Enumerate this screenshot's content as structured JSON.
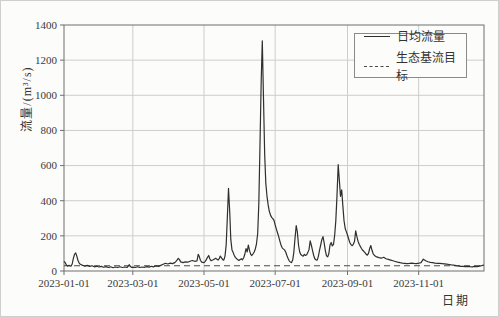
{
  "chart_data": {
    "type": "line",
    "title": "",
    "xlabel": "日期",
    "ylabel": "流量/(m³/s)",
    "ylim": [
      0,
      1400
    ],
    "x_range_days": [
      0,
      360
    ],
    "grid": true,
    "legend_position": "top-right",
    "colors": {
      "line": "#2f2f2f",
      "target": "#4a4a4a",
      "grid": "#cdcdcd",
      "frame": "#6f6f6f",
      "tick_text": "#3a3a3a"
    },
    "y_ticks": [
      0,
      200,
      400,
      600,
      800,
      1000,
      1200,
      1400
    ],
    "x_ticks": [
      {
        "day": 0,
        "label": "2023-01-01"
      },
      {
        "day": 59,
        "label": "2023-03-01"
      },
      {
        "day": 120,
        "label": "2023-05-01"
      },
      {
        "day": 181,
        "label": "2023-07-01"
      },
      {
        "day": 243,
        "label": "2023-09-01"
      },
      {
        "day": 304,
        "label": "2023-11-01"
      }
    ],
    "series": [
      {
        "name": "日均流量",
        "style": "solid",
        "points": [
          [
            0,
            55
          ],
          [
            1,
            48
          ],
          [
            2,
            35
          ],
          [
            3,
            28
          ],
          [
            4,
            32
          ],
          [
            5,
            30
          ],
          [
            6,
            28
          ],
          [
            7,
            40
          ],
          [
            8,
            70
          ],
          [
            9,
            95
          ],
          [
            10,
            103
          ],
          [
            11,
            85
          ],
          [
            12,
            60
          ],
          [
            13,
            45
          ],
          [
            14,
            38
          ],
          [
            16,
            32
          ],
          [
            18,
            28
          ],
          [
            20,
            32
          ],
          [
            22,
            26
          ],
          [
            24,
            30
          ],
          [
            26,
            24
          ],
          [
            28,
            27
          ],
          [
            30,
            23
          ],
          [
            32,
            26
          ],
          [
            34,
            21
          ],
          [
            36,
            25
          ],
          [
            38,
            20
          ],
          [
            40,
            24
          ],
          [
            42,
            19
          ],
          [
            44,
            23
          ],
          [
            46,
            20
          ],
          [
            48,
            24
          ],
          [
            50,
            20
          ],
          [
            52,
            23
          ],
          [
            54,
            20
          ],
          [
            55,
            28
          ],
          [
            56,
            36
          ],
          [
            57,
            25
          ],
          [
            58,
            20
          ],
          [
            59,
            22
          ],
          [
            61,
            20
          ],
          [
            63,
            24
          ],
          [
            65,
            20
          ],
          [
            67,
            23
          ],
          [
            69,
            21
          ],
          [
            71,
            25
          ],
          [
            73,
            22
          ],
          [
            75,
            27
          ],
          [
            77,
            24
          ],
          [
            79,
            29
          ],
          [
            81,
            26
          ],
          [
            83,
            32
          ],
          [
            85,
            38
          ],
          [
            87,
            44
          ],
          [
            89,
            40
          ],
          [
            91,
            45
          ],
          [
            93,
            42
          ],
          [
            95,
            48
          ],
          [
            96,
            55
          ],
          [
            97,
            63
          ],
          [
            98,
            72
          ],
          [
            99,
            65
          ],
          [
            100,
            52
          ],
          [
            102,
            48
          ],
          [
            104,
            52
          ],
          [
            106,
            50
          ],
          [
            108,
            56
          ],
          [
            110,
            60
          ],
          [
            112,
            55
          ],
          [
            114,
            58
          ],
          [
            115,
            95
          ],
          [
            116,
            82
          ],
          [
            117,
            60
          ],
          [
            118,
            50
          ],
          [
            120,
            47
          ],
          [
            121,
            55
          ],
          [
            122,
            65
          ],
          [
            123,
            78
          ],
          [
            124,
            88
          ],
          [
            125,
            70
          ],
          [
            126,
            58
          ],
          [
            128,
            64
          ],
          [
            130,
            72
          ],
          [
            132,
            62
          ],
          [
            133,
            70
          ],
          [
            134,
            85
          ],
          [
            135,
            75
          ],
          [
            136,
            65
          ],
          [
            137,
            62
          ],
          [
            138,
            85
          ],
          [
            139,
            150
          ],
          [
            140,
            300
          ],
          [
            141,
            470
          ],
          [
            142,
            340
          ],
          [
            143,
            180
          ],
          [
            144,
            120
          ],
          [
            145,
            105
          ],
          [
            146,
            88
          ],
          [
            147,
            76
          ],
          [
            148,
            70
          ],
          [
            149,
            64
          ],
          [
            150,
            60
          ],
          [
            151,
            65
          ],
          [
            152,
            70
          ],
          [
            153,
            64
          ],
          [
            154,
            75
          ],
          [
            155,
            95
          ],
          [
            156,
            128
          ],
          [
            157,
            108
          ],
          [
            158,
            148
          ],
          [
            159,
            118
          ],
          [
            160,
            95
          ],
          [
            161,
            88
          ],
          [
            162,
            98
          ],
          [
            163,
            108
          ],
          [
            164,
            125
          ],
          [
            165,
            155
          ],
          [
            166,
            215
          ],
          [
            167,
            380
          ],
          [
            168,
            720
          ],
          [
            169,
            1080
          ],
          [
            170,
            1310
          ],
          [
            171,
            980
          ],
          [
            172,
            660
          ],
          [
            173,
            500
          ],
          [
            174,
            425
          ],
          [
            175,
            375
          ],
          [
            176,
            340
          ],
          [
            177,
            318
          ],
          [
            178,
            305
          ],
          [
            179,
            298
          ],
          [
            180,
            288
          ],
          [
            181,
            262
          ],
          [
            182,
            240
          ],
          [
            183,
            218
          ],
          [
            184,
            195
          ],
          [
            185,
            172
          ],
          [
            186,
            148
          ],
          [
            187,
            132
          ],
          [
            188,
            126
          ],
          [
            189,
            120
          ],
          [
            190,
            108
          ],
          [
            191,
            90
          ],
          [
            192,
            72
          ],
          [
            193,
            58
          ],
          [
            194,
            52
          ],
          [
            195,
            48
          ],
          [
            196,
            62
          ],
          [
            197,
            105
          ],
          [
            198,
            185
          ],
          [
            199,
            258
          ],
          [
            200,
            225
          ],
          [
            201,
            148
          ],
          [
            202,
            108
          ],
          [
            203,
            94
          ],
          [
            204,
            88
          ],
          [
            205,
            84
          ],
          [
            206,
            95
          ],
          [
            207,
            88
          ],
          [
            208,
            92
          ],
          [
            209,
            105
          ],
          [
            210,
            122
          ],
          [
            211,
            172
          ],
          [
            212,
            148
          ],
          [
            213,
            118
          ],
          [
            214,
            88
          ],
          [
            215,
            70
          ],
          [
            216,
            64
          ],
          [
            217,
            62
          ],
          [
            218,
            82
          ],
          [
            219,
            118
          ],
          [
            220,
            148
          ],
          [
            221,
            178
          ],
          [
            222,
            196
          ],
          [
            223,
            158
          ],
          [
            224,
            118
          ],
          [
            225,
            86
          ],
          [
            226,
            80
          ],
          [
            227,
            98
          ],
          [
            228,
            148
          ],
          [
            229,
            162
          ],
          [
            230,
            142
          ],
          [
            231,
            152
          ],
          [
            232,
            205
          ],
          [
            233,
            285
          ],
          [
            234,
            430
          ],
          [
            235,
            605
          ],
          [
            236,
            520
          ],
          [
            237,
            425
          ],
          [
            238,
            462
          ],
          [
            239,
            375
          ],
          [
            240,
            288
          ],
          [
            241,
            242
          ],
          [
            242,
            224
          ],
          [
            243,
            205
          ],
          [
            244,
            182
          ],
          [
            245,
            162
          ],
          [
            246,
            150
          ],
          [
            247,
            144
          ],
          [
            248,
            152
          ],
          [
            249,
            168
          ],
          [
            250,
            228
          ],
          [
            251,
            198
          ],
          [
            252,
            170
          ],
          [
            253,
            152
          ],
          [
            254,
            140
          ],
          [
            255,
            128
          ],
          [
            256,
            118
          ],
          [
            257,
            112
          ],
          [
            258,
            104
          ],
          [
            259,
            95
          ],
          [
            260,
            90
          ],
          [
            261,
            100
          ],
          [
            262,
            128
          ],
          [
            263,
            145
          ],
          [
            264,
            118
          ],
          [
            265,
            98
          ],
          [
            266,
            90
          ],
          [
            267,
            84
          ],
          [
            268,
            80
          ],
          [
            270,
            76
          ],
          [
            272,
            73
          ],
          [
            274,
            78
          ],
          [
            276,
            70
          ],
          [
            278,
            66
          ],
          [
            280,
            62
          ],
          [
            282,
            58
          ],
          [
            284,
            54
          ],
          [
            286,
            50
          ],
          [
            288,
            47
          ],
          [
            290,
            45
          ],
          [
            292,
            44
          ],
          [
            294,
            42
          ],
          [
            296,
            43
          ],
          [
            298,
            45
          ],
          [
            300,
            43
          ],
          [
            302,
            42
          ],
          [
            303,
            44
          ],
          [
            304,
            44
          ],
          [
            306,
            48
          ],
          [
            307,
            58
          ],
          [
            308,
            67
          ],
          [
            309,
            63
          ],
          [
            310,
            58
          ],
          [
            312,
            53
          ],
          [
            314,
            49
          ],
          [
            316,
            47
          ],
          [
            318,
            45
          ],
          [
            320,
            44
          ],
          [
            322,
            43
          ],
          [
            324,
            42
          ],
          [
            326,
            41
          ],
          [
            328,
            39
          ],
          [
            330,
            37
          ],
          [
            332,
            35
          ],
          [
            334,
            33
          ],
          [
            336,
            31
          ],
          [
            338,
            29
          ],
          [
            340,
            27
          ],
          [
            342,
            26
          ],
          [
            344,
            25
          ],
          [
            346,
            27
          ],
          [
            348,
            25
          ],
          [
            350,
            24
          ],
          [
            352,
            26
          ],
          [
            354,
            25
          ],
          [
            356,
            28
          ],
          [
            358,
            31
          ],
          [
            360,
            34
          ]
        ]
      },
      {
        "name": "生态基流目标",
        "style": "dashed",
        "constant_value": 30
      }
    ]
  }
}
